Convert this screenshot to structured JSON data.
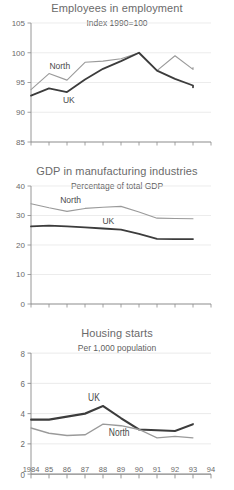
{
  "figure": {
    "background": "#ffffff",
    "series_colors": {
      "uk": "#3c3c3c",
      "north": "#9a9a9a"
    },
    "shared_x_axis": {
      "tick_labels": [
        "1984",
        "85",
        "86",
        "87",
        "88",
        "89",
        "90",
        "91",
        "92",
        "93",
        "94"
      ],
      "values": [
        1984,
        1985,
        1986,
        1987,
        1988,
        1989,
        1990,
        1991,
        1992,
        1993,
        1994
      ]
    }
  },
  "chart_data": [
    {
      "type": "line",
      "title": "Employees in employment",
      "subtitle": "Index 1990=100",
      "xlabel": "",
      "ylabel": "",
      "xlim": [
        1984,
        1994
      ],
      "ylim": [
        85,
        105
      ],
      "grid": true,
      "legend_position": "inline-annotation",
      "x": [
        1984,
        1985,
        1986,
        1987,
        1988,
        1989,
        1990,
        1991,
        1992,
        1993
      ],
      "ytick_labels": [
        "85",
        "90",
        "95",
        "100",
        "105"
      ],
      "ytick_values": [
        85,
        90,
        95,
        100,
        105
      ],
      "series": [
        {
          "name": "North",
          "values": [
            93.8,
            96.5,
            95.4,
            98.4,
            98.6,
            99.0,
            100.0,
            97.0,
            99.5,
            97.2,
            97.5
          ]
        },
        {
          "name": "UK",
          "values": [
            92.8,
            94.0,
            93.4,
            95.5,
            97.3,
            98.6,
            100.0,
            97.0,
            95.6,
            94.5,
            94.2
          ]
        }
      ],
      "annotations": [
        {
          "text": "North",
          "x": 1985.6,
          "y": 97.2
        },
        {
          "text": "UK",
          "x": 1986.1,
          "y": 91.6
        }
      ]
    },
    {
      "type": "line",
      "title": "GDP in manufacturing industries",
      "subtitle": "Percentage of total GDP",
      "xlabel": "",
      "ylabel": "",
      "xlim": [
        1984,
        1994
      ],
      "ylim": [
        0,
        40
      ],
      "grid": true,
      "legend_position": "inline-annotation",
      "x": [
        1984,
        1985,
        1986,
        1987,
        1988,
        1989,
        1990,
        1991,
        1992,
        1993
      ],
      "ytick_labels": [
        "0",
        "10",
        "20",
        "30",
        "40"
      ],
      "ytick_values": [
        0,
        10,
        20,
        30,
        40
      ],
      "series": [
        {
          "name": "North",
          "values": [
            34.0,
            32.6,
            31.4,
            32.4,
            32.8,
            33.1,
            31.2,
            29.1,
            29.0,
            28.9
          ]
        },
        {
          "name": "UK",
          "values": [
            26.3,
            26.6,
            26.3,
            26.0,
            25.6,
            25.2,
            23.8,
            22.1,
            22.0,
            22.0
          ]
        }
      ],
      "annotations": [
        {
          "text": "North",
          "x": 1986.2,
          "y": 34.4
        },
        {
          "text": "UK",
          "x": 1988.3,
          "y": 27.2
        }
      ]
    },
    {
      "type": "line",
      "title": "Housing starts",
      "subtitle": "Per 1,000 population",
      "xlabel": "",
      "ylabel": "",
      "xlim": [
        1984,
        1994
      ],
      "ylim": [
        0,
        8
      ],
      "grid": true,
      "legend_position": "inline-annotation",
      "x": [
        1984,
        1985,
        1986,
        1987,
        1988,
        1989,
        1990,
        1991,
        1992,
        1993
      ],
      "ytick_labels": [
        "0",
        "2",
        "4",
        "6",
        "8"
      ],
      "ytick_values": [
        0,
        2,
        4,
        6,
        8
      ],
      "series": [
        {
          "name": "UK",
          "values": [
            3.6,
            3.6,
            3.8,
            4.0,
            4.5,
            3.7,
            2.95,
            2.9,
            2.85,
            3.3
          ]
        },
        {
          "name": "North",
          "values": [
            3.05,
            2.7,
            2.55,
            2.6,
            3.3,
            3.2,
            2.95,
            2.4,
            2.5,
            2.4
          ]
        }
      ],
      "annotations": [
        {
          "text": "UK",
          "x": 1987.5,
          "y": 4.85
        },
        {
          "text": "North",
          "x": 1988.9,
          "y": 2.55
        }
      ]
    }
  ]
}
